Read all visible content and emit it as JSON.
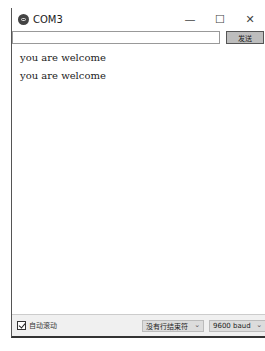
{
  "window": {
    "title": "COM3",
    "icon": "arduino-icon",
    "controls": {
      "minimize": "—",
      "maximize": "☐",
      "close": "✕"
    }
  },
  "input": {
    "value": "",
    "placeholder": "",
    "send_label": "发送"
  },
  "output": {
    "lines": [
      "you are welcome",
      "you are welcome"
    ]
  },
  "footer": {
    "autoscroll_label": "自动滚动",
    "autoscroll_checked": true,
    "line_ending": "没有行结束符",
    "baud_rate": "9600 baud",
    "chevron": "⌄"
  }
}
